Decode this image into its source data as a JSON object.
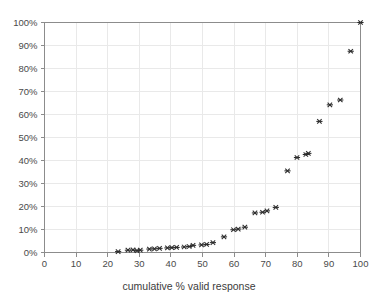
{
  "chart_data": {
    "type": "scatter",
    "title": "",
    "subtitle": "",
    "xlabel": "cumulative % valid response",
    "ylabel": "",
    "xlim": [
      0,
      100
    ],
    "ylim": [
      0,
      100
    ],
    "x_ticks": [
      0,
      10,
      20,
      30,
      40,
      50,
      60,
      70,
      80,
      90,
      100
    ],
    "x_tick_labels": [
      "0",
      "10",
      "20",
      "30",
      "40",
      "50",
      "60",
      "70",
      "80",
      "90",
      "100"
    ],
    "y_ticks": [
      0,
      10,
      20,
      30,
      40,
      50,
      60,
      70,
      80,
      90,
      100
    ],
    "y_tick_labels": [
      "0%",
      "10%",
      "20%",
      "30%",
      "40%",
      "50%",
      "60%",
      "70%",
      "80%",
      "90%",
      "100%"
    ],
    "grid": true,
    "legend": null,
    "legend_position": "none",
    "marker": "x-star",
    "marker_color": "#2b2b2b",
    "series": [
      {
        "name": "cumulative response",
        "points": [
          [
            23.3,
            0.4
          ],
          [
            26.4,
            1.0
          ],
          [
            28.0,
            1.1
          ],
          [
            29.3,
            0.8
          ],
          [
            30.3,
            1.0
          ],
          [
            33.2,
            1.5
          ],
          [
            34.8,
            1.6
          ],
          [
            36.4,
            1.8
          ],
          [
            38.9,
            2.0
          ],
          [
            40.3,
            2.1
          ],
          [
            41.8,
            2.2
          ],
          [
            44.2,
            2.4
          ],
          [
            45.8,
            2.6
          ],
          [
            47.0,
            3.1
          ],
          [
            49.7,
            3.3
          ],
          [
            51.3,
            3.5
          ],
          [
            53.3,
            4.3
          ],
          [
            56.8,
            6.8
          ],
          [
            59.8,
            9.9
          ],
          [
            61.3,
            10.2
          ],
          [
            63.4,
            11.0
          ],
          [
            66.6,
            17.2
          ],
          [
            69.0,
            17.5
          ],
          [
            70.4,
            18.1
          ],
          [
            73.2,
            19.6
          ],
          [
            76.9,
            35.5
          ],
          [
            79.9,
            41.3
          ],
          [
            82.7,
            42.6
          ],
          [
            83.5,
            43.1
          ],
          [
            87.0,
            57.0
          ],
          [
            90.3,
            64.2
          ],
          [
            93.6,
            66.3
          ],
          [
            96.9,
            87.5
          ],
          [
            100.0,
            100.0
          ]
        ]
      }
    ]
  },
  "axes": {
    "x_axis_name": "x-axis",
    "y_axis_name": "y-axis"
  }
}
